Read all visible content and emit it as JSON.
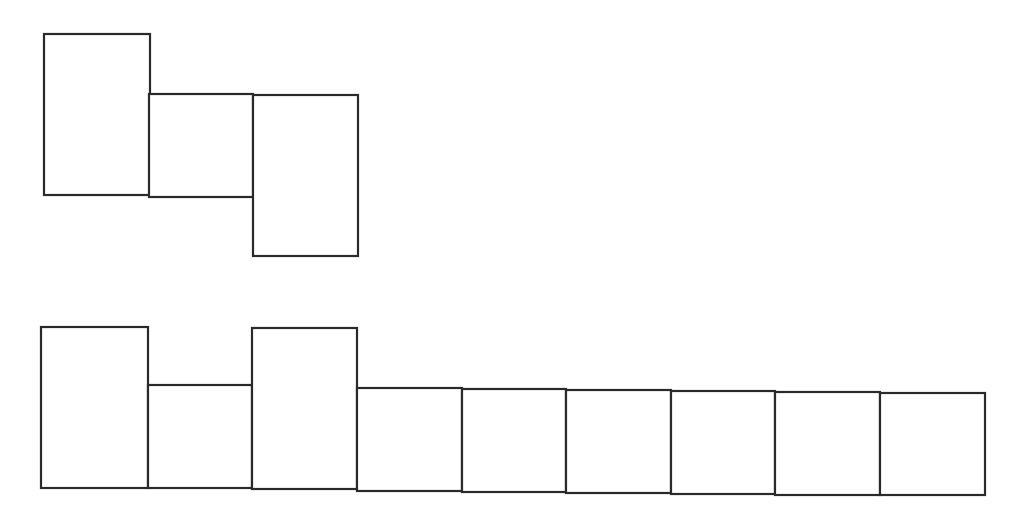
{
  "diagram": {
    "background": "#ffffff",
    "stroke_color": "#2a2a2a",
    "groups": [
      {
        "name": "top-group",
        "boxes": [
          {
            "x": 44,
            "y": 34,
            "w": 106,
            "h": 161
          },
          {
            "x": 149,
            "y": 94,
            "w": 104,
            "h": 103
          },
          {
            "x": 253,
            "y": 95,
            "w": 105,
            "h": 161
          }
        ]
      },
      {
        "name": "bottom-group",
        "boxes": [
          {
            "x": 41,
            "y": 327,
            "w": 107,
            "h": 161
          },
          {
            "x": 148,
            "y": 385,
            "w": 104,
            "h": 103
          },
          {
            "x": 252,
            "y": 328,
            "w": 105,
            "h": 161
          },
          {
            "x": 357,
            "y": 388,
            "w": 105,
            "h": 103
          },
          {
            "x": 462,
            "y": 389,
            "w": 104,
            "h": 103
          },
          {
            "x": 566,
            "y": 390,
            "w": 105,
            "h": 103
          },
          {
            "x": 671,
            "y": 391,
            "w": 104,
            "h": 103
          },
          {
            "x": 775,
            "y": 392,
            "w": 105,
            "h": 103
          },
          {
            "x": 880,
            "y": 393,
            "w": 105,
            "h": 102
          }
        ]
      }
    ]
  }
}
